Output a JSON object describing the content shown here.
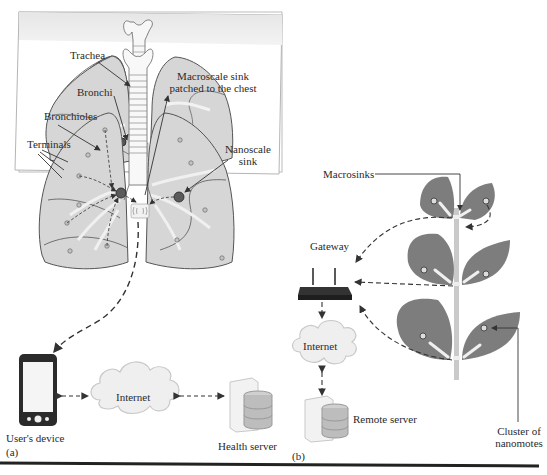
{
  "panel_a": {
    "caption": "(a)",
    "labels": {
      "trachea": "Trachea",
      "bronchi": "Bronchi",
      "bronchioles": "Bronchioles",
      "terminals": "Terminals",
      "macroscale_sink_line1": "Macroscale sink",
      "macroscale_sink_line2": "patched to the chest",
      "nanoscale_sink_line1": "Nanoscale",
      "nanoscale_sink_line2": "sink",
      "internet": "Internet",
      "users_device": "User's device",
      "health_server": "Health server"
    }
  },
  "panel_b": {
    "caption": "(b)",
    "labels": {
      "macrosinks": "Macrosinks",
      "gateway": "Gateway",
      "internet": "Internet",
      "remote_server": "Remote server",
      "cluster_line1": "Cluster of",
      "cluster_line2": "nanomotes"
    }
  },
  "colors": {
    "lung_fill": "#d4d4d4",
    "lung_stroke": "#555555",
    "leaf_fill": "#7a7a7a",
    "stem": "#c8c8c8",
    "arrow": "#333333",
    "cloud_fill": "#eeeeee"
  }
}
